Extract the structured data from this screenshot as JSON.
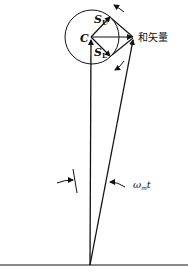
{
  "diagram": {
    "labels": {
      "carrier": "C",
      "upper_sideband_main": "S",
      "upper_sideband_sub": "U",
      "lower_sideband_main": "S",
      "lower_sideband_sub": "L",
      "sum_vector": "和矢量",
      "angle_main": "ω",
      "angle_sub": "m",
      "angle_suffix": "t"
    },
    "colors": {
      "stroke": "#111111",
      "background": "#ffffff"
    }
  }
}
